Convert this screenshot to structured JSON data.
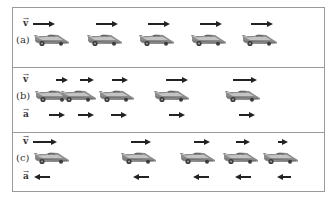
{
  "figure": {
    "frame_color": "#9a9a9a",
    "arrow_color": "#222222",
    "panels": [
      {
        "id": "a",
        "label": "(a)",
        "top": 0,
        "height": 59,
        "vectors": [
          {
            "symbol": "v",
            "row_y": 13,
            "label_x": 10,
            "arrows": [
              {
                "x": 20,
                "length": 22,
                "direction": "right"
              },
              {
                "x": 83,
                "length": 22,
                "direction": "right"
              },
              {
                "x": 135,
                "length": 22,
                "direction": "right"
              },
              {
                "x": 187,
                "length": 22,
                "direction": "right"
              },
              {
                "x": 238,
                "length": 22,
                "direction": "right"
              }
            ]
          }
        ],
        "car_y": 25,
        "cars_x": [
          21,
          74,
          126,
          178,
          229
        ]
      },
      {
        "id": "b",
        "label": "(b)",
        "top": 59,
        "height": 65,
        "vectors": [
          {
            "symbol": "v",
            "row_y": 9,
            "label_x": 10,
            "arrows": [
              {
                "x": 43,
                "length": 12,
                "direction": "right"
              },
              {
                "x": 67,
                "length": 14,
                "direction": "right"
              },
              {
                "x": 99,
                "length": 16,
                "direction": "right"
              },
              {
                "x": 153,
                "length": 22,
                "direction": "right"
              },
              {
                "x": 220,
                "length": 24,
                "direction": "right"
              }
            ]
          },
          {
            "symbol": "a",
            "row_y": 44,
            "label_x": 10,
            "arrows": [
              {
                "x": 36,
                "length": 16,
                "direction": "right"
              },
              {
                "x": 65,
                "length": 16,
                "direction": "right"
              },
              {
                "x": 98,
                "length": 16,
                "direction": "right"
              },
              {
                "x": 156,
                "length": 16,
                "direction": "right"
              },
              {
                "x": 226,
                "length": 16,
                "direction": "right"
              }
            ]
          }
        ],
        "car_y": 21,
        "cars_x": [
          22,
          48,
          86,
          141,
          212
        ]
      },
      {
        "id": "c",
        "label": "(c)",
        "top": 124,
        "height": 61,
        "vectors": [
          {
            "symbol": "v",
            "row_y": 6,
            "label_x": 10,
            "arrows": [
              {
                "x": 20,
                "length": 24,
                "direction": "right"
              },
              {
                "x": 118,
                "length": 20,
                "direction": "right"
              },
              {
                "x": 181,
                "length": 16,
                "direction": "right"
              },
              {
                "x": 223,
                "length": 14,
                "direction": "right"
              },
              {
                "x": 265,
                "length": 10,
                "direction": "right"
              }
            ]
          },
          {
            "symbol": "a",
            "row_y": 41,
            "label_x": 10,
            "arrows": [
              {
                "x": 21,
                "length": 16,
                "direction": "left"
              },
              {
                "x": 120,
                "length": 16,
                "direction": "left"
              },
              {
                "x": 180,
                "length": 16,
                "direction": "left"
              },
              {
                "x": 222,
                "length": 16,
                "direction": "left"
              },
              {
                "x": 264,
                "length": 14,
                "direction": "left"
              }
            ]
          }
        ],
        "car_y": 18,
        "cars_x": [
          21,
          108,
          167,
          210,
          250
        ]
      }
    ]
  }
}
